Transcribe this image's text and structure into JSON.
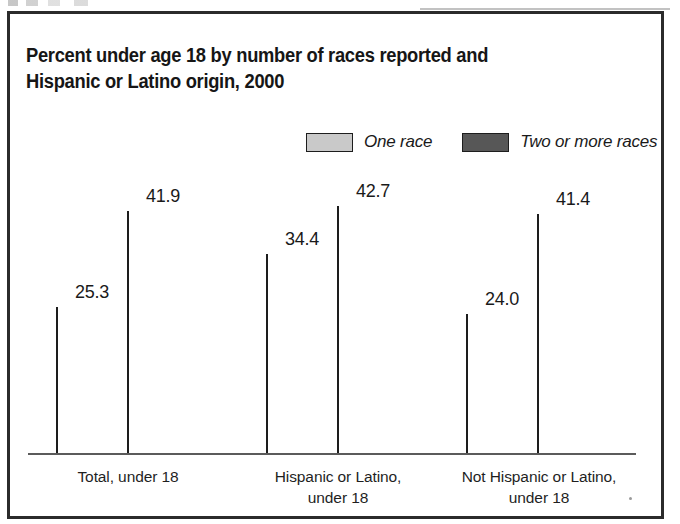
{
  "figure": {
    "title": "Percent under age 18 by number of races reported and\nHispanic or Latino origin, 2000"
  },
  "legend": {
    "items": [
      {
        "label": "One race",
        "swatch": "light",
        "color": "#c9c9c9"
      },
      {
        "label": "Two or more races",
        "swatch": "dark",
        "color": "#575757"
      }
    ]
  },
  "chart_data": {
    "type": "bar",
    "title": "Percent under age 18 by number of races reported and Hispanic or Latino origin, 2000",
    "xlabel": "",
    "ylabel": "",
    "ylim": [
      0,
      45
    ],
    "grid": false,
    "legend_position": "top-right",
    "categories": [
      "Total, under 18",
      "Hispanic or Latino,\nunder 18",
      "Not Hispanic or Latino,\nunder 18"
    ],
    "series": [
      {
        "name": "One race",
        "color": "#c9c9c9",
        "values": [
          25.3,
          34.4,
          24.0
        ]
      },
      {
        "name": "Two or more races",
        "color": "#575757",
        "values": [
          41.9,
          42.7,
          41.4
        ]
      }
    ],
    "value_labels": [
      [
        "25.3",
        "41.9"
      ],
      [
        "34.4",
        "42.7"
      ],
      [
        "24.0",
        "41.4"
      ]
    ]
  }
}
